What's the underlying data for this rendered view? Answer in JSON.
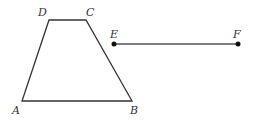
{
  "diagram": {
    "type": "geometry",
    "colors": {
      "stroke": "#333333",
      "segment": "#555555",
      "point": "#111111",
      "label": "#333333"
    },
    "trapezoid": {
      "vertices": [
        {
          "name": "A",
          "x": 22,
          "y": 101,
          "label_x": 12,
          "label_y": 114
        },
        {
          "name": "B",
          "x": 132,
          "y": 101,
          "label_x": 130,
          "label_y": 114
        },
        {
          "name": "C",
          "x": 86,
          "y": 20,
          "label_x": 86,
          "label_y": 16
        },
        {
          "name": "D",
          "x": 49,
          "y": 20,
          "label_x": 38,
          "label_y": 16
        }
      ]
    },
    "segment": {
      "start": {
        "name": "E",
        "x": 114,
        "y": 44,
        "label_x": 110,
        "label_y": 38
      },
      "end": {
        "name": "F",
        "x": 238,
        "y": 44,
        "label_x": 233,
        "label_y": 38
      }
    },
    "labels": {
      "A": "A",
      "B": "B",
      "C": "C",
      "D": "D",
      "E": "E",
      "F": "F"
    }
  }
}
